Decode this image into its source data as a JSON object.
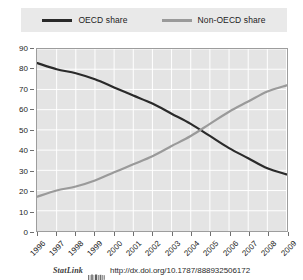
{
  "legend": {
    "position": "top",
    "entries": [
      {
        "label": "OECD share",
        "color": "#2a2a2a",
        "icon": "line-swatch-icon"
      },
      {
        "label": "Non-OECD share",
        "color": "#9a9a9a",
        "icon": "line-swatch-icon"
      }
    ]
  },
  "footer": {
    "statlink_label": "StatLink",
    "statlink_icon": "statlink-barcode-icon",
    "url": "http://dx.doi.org/10.1787/888932506172"
  },
  "colors": {
    "plot_background": "#e4e4e4",
    "gridline": "#ffffff",
    "axis": "#9d9d9d",
    "oecd": "#2a2a2a",
    "non_oecd": "#9a9a9a",
    "legend_band": "#e9e9e9",
    "page_background": "#ffffff"
  },
  "chart_data": {
    "type": "line",
    "title": "",
    "subtitle": "",
    "xlabel": "",
    "ylabel": "",
    "x": [
      "1996",
      "1997",
      "1998",
      "1999",
      "2000",
      "2001",
      "2002",
      "2003",
      "2004",
      "2005",
      "2006",
      "2007",
      "2008",
      "2009"
    ],
    "categories": [
      "1996",
      "1997",
      "1998",
      "1999",
      "2000",
      "2001",
      "2002",
      "2003",
      "2004",
      "2005",
      "2006",
      "2007",
      "2008",
      "2009"
    ],
    "series": [
      {
        "name": "OECD share",
        "color": "#2a2a2a",
        "values": [
          83,
          80,
          78,
          75,
          71,
          67,
          63,
          58,
          53,
          47,
          41,
          36,
          31,
          28
        ]
      },
      {
        "name": "Non-OECD share",
        "color": "#9a9a9a",
        "values": [
          17,
          20,
          22,
          25,
          29,
          33,
          37,
          42,
          47,
          53,
          59,
          64,
          69,
          72
        ]
      }
    ],
    "ylim": [
      0,
      90
    ],
    "ytick_step": 10,
    "yticks": [
      0,
      10,
      20,
      30,
      40,
      50,
      60,
      70,
      80,
      90
    ],
    "ytick_labels": [
      "0",
      "10",
      "20",
      "30",
      "40",
      "50",
      "60",
      "70",
      "80",
      "90"
    ],
    "xtick_labels": [
      "1996",
      "1997",
      "1998",
      "1999",
      "2000",
      "2001",
      "2002",
      "2003",
      "2004",
      "2005",
      "2006",
      "2007",
      "2008",
      "2009"
    ],
    "xtick_rotation": -45,
    "grid": true,
    "grid_axis": "both",
    "legend_position": "top"
  }
}
